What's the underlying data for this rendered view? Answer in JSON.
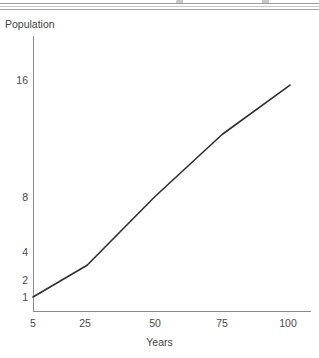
{
  "chart_data": {
    "type": "line",
    "title": "",
    "subtitle": "",
    "xlabel": "Years",
    "ylabel": "Population",
    "yscale": "log2",
    "xscale": "linear",
    "grid": false,
    "legend": false,
    "legend_position": "none",
    "xlim": [
      5,
      100
    ],
    "ylim": [
      0.85,
      20
    ],
    "xticks": [
      5,
      25,
      50,
      75,
      100
    ],
    "xtick_labels": [
      "5",
      "25",
      "50",
      "75",
      "100"
    ],
    "yticks": [
      1,
      2,
      4,
      8,
      16
    ],
    "ytick_labels": [
      "1",
      "2",
      "4",
      "8",
      "16"
    ],
    "series": [
      {
        "name": "Population",
        "color": "#2f2f2f",
        "x": [
          5,
          25,
          50,
          75,
          100
        ],
        "y": [
          1.0,
          1.5,
          3.6,
          8.0,
          15.0
        ]
      }
    ]
  },
  "axes": {
    "y_title": "Population",
    "x_title": "Years"
  },
  "ticks": {
    "y": [
      {
        "label": "16",
        "value": 16
      },
      {
        "label": "8",
        "value": 8
      },
      {
        "label": "4",
        "value": 4
      },
      {
        "label": "2",
        "value": 2
      },
      {
        "label": "1",
        "value": 1
      }
    ],
    "x": [
      {
        "label": "5",
        "value": 5
      },
      {
        "label": "25",
        "value": 25
      },
      {
        "label": "50",
        "value": 50
      },
      {
        "label": "75",
        "value": 75
      },
      {
        "label": "100",
        "value": 100
      }
    ]
  },
  "style": {
    "axis_color": "#8a8a8a",
    "line_color": "#2f2f2f",
    "text_color": "#4a4a4a",
    "background": "#ffffff"
  }
}
